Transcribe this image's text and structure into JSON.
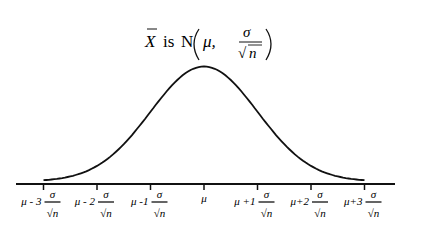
{
  "title": {
    "xbar": "X",
    "is": "is",
    "N": "N",
    "mu": "μ,",
    "sigma": "σ",
    "sqrt": "√",
    "n": "n"
  },
  "axis": {
    "ticks": [
      {
        "prefix": "μ - 3",
        "has_fraction": true
      },
      {
        "prefix": "μ - 2",
        "has_fraction": true
      },
      {
        "prefix": "μ -1",
        "has_fraction": true
      },
      {
        "prefix": "μ",
        "has_fraction": false
      },
      {
        "prefix": "μ +1",
        "has_fraction": true
      },
      {
        "prefix": "μ+2",
        "has_fraction": true
      },
      {
        "prefix": "μ+3",
        "has_fraction": true
      }
    ],
    "fraction_num": "σ",
    "fraction_den": "n",
    "sqrt_symbol": "√"
  },
  "chart_data": {
    "type": "line",
    "x_tick_labels": [
      "μ-3σ/√n",
      "μ-2σ/√n",
      "μ-1σ/√n",
      "μ",
      "μ+1σ/√n",
      "μ+2σ/√n",
      "μ+3σ/√n"
    ],
    "x_range_in_sd": [
      -3,
      3
    ],
    "series": [
      {
        "name": "density",
        "shape": "standard normal",
        "mean": 0,
        "sd": 1
      }
    ],
    "grid": false,
    "legend": false,
    "colors": {
      "line": "#111111",
      "background": "#ffffff"
    }
  }
}
